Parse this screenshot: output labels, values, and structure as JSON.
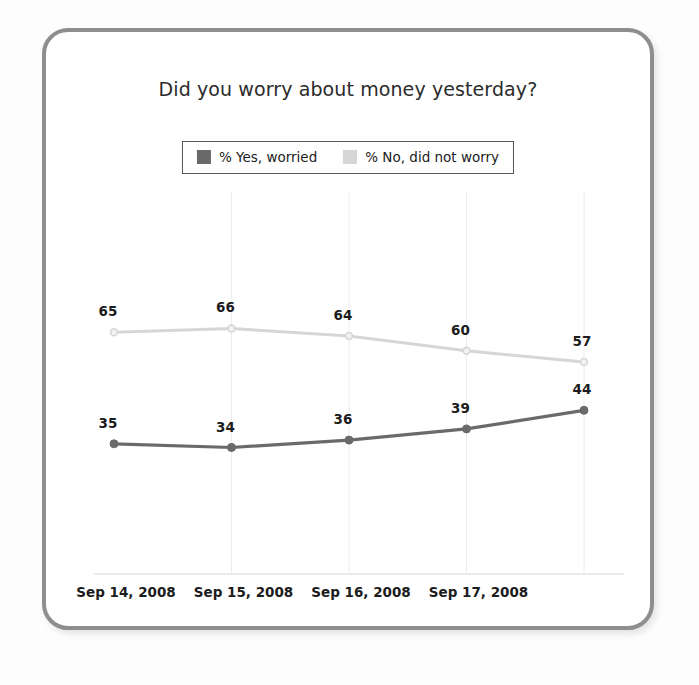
{
  "card": {
    "border_color": "#8e8e8e",
    "background": "#ffffff"
  },
  "chart_data": {
    "type": "line",
    "title": "Did you worry about money yesterday?",
    "xlabel": "",
    "ylabel": "",
    "ylim": [
      0,
      100
    ],
    "grid": "vertical-only",
    "legend_position": "top-center",
    "x": [
      "Sep 14, 2008",
      "Sep 15, 2008",
      "Sep 16, 2008",
      "Sep 17, 2008",
      ""
    ],
    "tick_labels": [
      "Sep 14, 2008",
      "Sep 15, 2008",
      "Sep 16, 2008",
      "Sep 17, 2008"
    ],
    "series": [
      {
        "name": "% Yes, worried",
        "color": "#6a6a6a",
        "values": [
          35,
          34,
          36,
          39,
          44
        ],
        "labels": [
          "35",
          "34",
          "36",
          "39",
          "44"
        ]
      },
      {
        "name": "% No, did not worry",
        "color": "#d6d6d6",
        "values": [
          65,
          66,
          64,
          60,
          57
        ],
        "labels": [
          "65",
          "66",
          "64",
          "60",
          "57"
        ]
      }
    ]
  },
  "legend": {
    "items": [
      {
        "label": "% Yes, worried",
        "color": "#6a6a6a"
      },
      {
        "label": "% No, did not worry",
        "color": "#d6d6d6"
      }
    ]
  }
}
